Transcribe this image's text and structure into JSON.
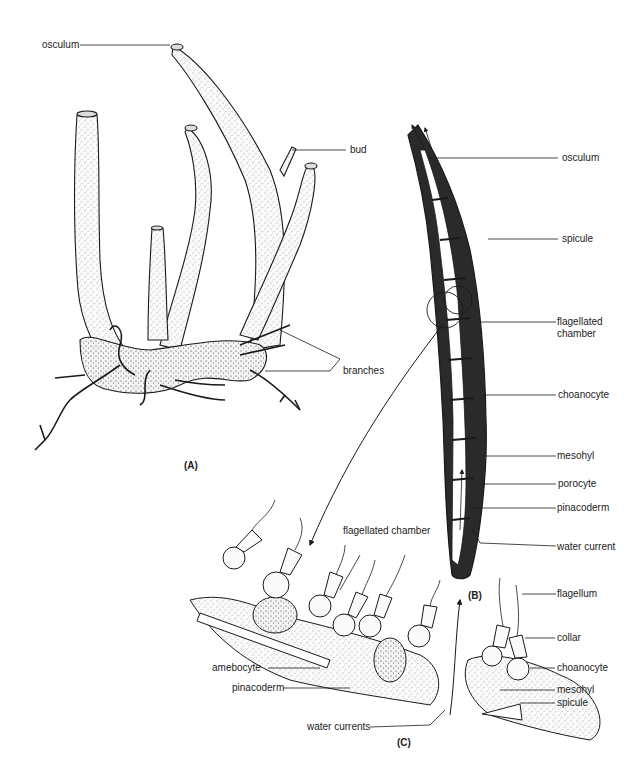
{
  "figure": {
    "panels": {
      "A": {
        "label": "(A)",
        "annotations": {
          "osculum": "osculum",
          "bud": "bud",
          "branches": "branches"
        }
      },
      "B": {
        "label": "(B)",
        "annotations": {
          "osculum": "osculum",
          "spicule": "spicule",
          "flagellated_chamber_line1": "flagellated",
          "flagellated_chamber_line2": "chamber",
          "choanocyte": "choanocyte",
          "mesohyl": "mesohyl",
          "porocyte": "porocyte",
          "pinacoderm": "pinacoderm",
          "water_current": "water current"
        }
      },
      "C": {
        "label": "(C)",
        "annotations": {
          "flagellated_chamber": "flagellated chamber",
          "amebocyte": "amebocyte",
          "pinacoderm": "pinacoderm",
          "water_currents": "water currents",
          "flagellum": "flagellum",
          "collar": "collar",
          "choanocyte": "choanocyte",
          "mesohyl": "mesohyl",
          "spicule": "spicule"
        }
      }
    },
    "colors": {
      "ink": "#1a1a1a",
      "stipple_fill": "#f4f4f4",
      "background": "#ffffff"
    }
  }
}
